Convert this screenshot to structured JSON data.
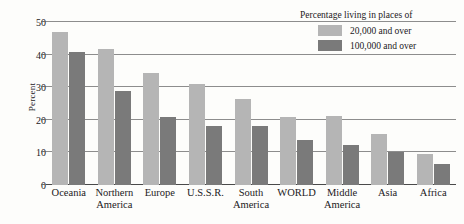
{
  "chart_data": {
    "type": "bar",
    "title": "",
    "xlabel": "",
    "ylabel": "Percent",
    "ylim": [
      0,
      50
    ],
    "yticks": [
      0,
      10,
      20,
      30,
      40,
      50
    ],
    "grid": true,
    "legend_position": "top-right",
    "legend_title": "Percentage living in places of",
    "categories": [
      "Oceania",
      "Northern America",
      "Europe",
      "U.S.S.R.",
      "South America",
      "WORLD",
      "Middle America",
      "Asia",
      "Africa"
    ],
    "category_lines": [
      [
        "Oceania",
        ""
      ],
      [
        "Northern",
        "America"
      ],
      [
        "Europe",
        ""
      ],
      [
        "U.S.S.R.",
        ""
      ],
      [
        "South",
        "America"
      ],
      [
        "WORLD",
        ""
      ],
      [
        "Middle",
        "America"
      ],
      [
        "Asia",
        ""
      ],
      [
        "Africa",
        ""
      ]
    ],
    "series": [
      {
        "name": "20,000 and over",
        "color": "#b5b5b5",
        "values": [
          47,
          41.7,
          34.5,
          31,
          26.3,
          21,
          21.3,
          15.7,
          9.6
        ]
      },
      {
        "name": "100,000 and over",
        "color": "#7a7a7a",
        "values": [
          40.8,
          28.8,
          20.8,
          18,
          18,
          13.7,
          12.4,
          10,
          6.5
        ]
      }
    ]
  },
  "legend": {
    "title": "Percentage living in places of",
    "entries": [
      {
        "label": "20,000 and over",
        "swatch": "light"
      },
      {
        "label": "100,000 and over",
        "swatch": "dark"
      }
    ]
  },
  "axis": {
    "y_title": "Percent"
  }
}
